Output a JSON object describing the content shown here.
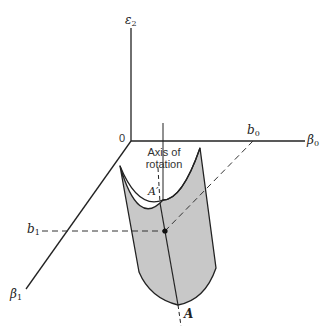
{
  "diagram": {
    "axes": {
      "vertical": {
        "symbol": "ε",
        "subscript": "2"
      },
      "right": {
        "symbol": "β",
        "subscript": "0"
      },
      "diagonal": {
        "symbol": "β",
        "subscript": "1"
      },
      "origin": "0"
    },
    "ticks": {
      "b0": {
        "symbol": "b",
        "subscript": "0"
      },
      "b1": {
        "symbol": "b",
        "subscript": "1"
      }
    },
    "annotations": {
      "axis_line1": "Axis of",
      "axis_line2": "rotation",
      "a_prime": "A′",
      "a": "A"
    },
    "colors": {
      "line": "#222222",
      "surface_fill": "#c8c8c8",
      "background": "#ffffff"
    }
  }
}
